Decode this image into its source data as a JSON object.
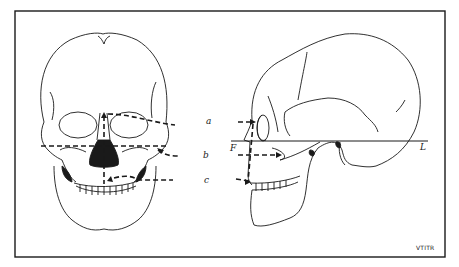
{
  "figure": {
    "labels": {
      "a": "a",
      "b": "b",
      "c": "c",
      "F": "F",
      "L": "L"
    },
    "credit": "VTITR",
    "colors": {
      "ink": "#1a1a1a",
      "background": "#ffffff"
    }
  }
}
